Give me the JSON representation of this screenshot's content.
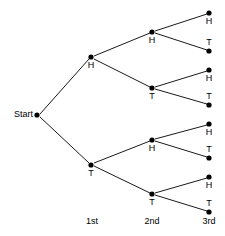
{
  "figure": {
    "type": "tree-diagram",
    "background_color": "#ffffff",
    "line_color": "#1a1a1a",
    "node_color": "#000000",
    "text_color": "#000000"
  },
  "start": {
    "label": "Start",
    "label_x": 33,
    "label_y": 115,
    "node_x": 37,
    "node_y": 115,
    "radius": 2.6
  },
  "stage_labels": [
    {
      "text": "1st",
      "x": 92,
      "y": 224
    },
    {
      "text": "2nd",
      "x": 152,
      "y": 224
    },
    {
      "text": "3rd",
      "x": 209,
      "y": 224
    }
  ],
  "level1": [
    {
      "id": "l1-h",
      "label": "H",
      "node_x": 91,
      "node_y": 57,
      "label_x": 91,
      "label_y": 68,
      "label_position": "below",
      "radius": 2.6
    },
    {
      "id": "l1-t",
      "label": "T",
      "node_x": 91,
      "node_y": 165,
      "label_x": 91,
      "label_y": 176,
      "label_position": "below",
      "radius": 2.6
    }
  ],
  "level2": [
    {
      "id": "l2-hh",
      "label": "H",
      "parent": "l1-h",
      "node_x": 152,
      "node_y": 32,
      "label_x": 152,
      "label_y": 43,
      "label_position": "below",
      "radius": 2.6
    },
    {
      "id": "l2-ht",
      "label": "T",
      "parent": "l1-h",
      "node_x": 152,
      "node_y": 88,
      "label_x": 152,
      "label_y": 99,
      "label_position": "below",
      "radius": 2.6
    },
    {
      "id": "l2-th",
      "label": "H",
      "parent": "l1-t",
      "node_x": 152,
      "node_y": 140,
      "label_x": 152,
      "label_y": 151,
      "label_position": "below",
      "radius": 2.6
    },
    {
      "id": "l2-tt",
      "label": "T",
      "parent": "l1-t",
      "node_x": 152,
      "node_y": 194,
      "label_x": 152,
      "label_y": 205,
      "label_position": "below",
      "radius": 2.6
    }
  ],
  "level3": [
    {
      "id": "l3-hhh",
      "label": "H",
      "parent": "l2-hh",
      "node_x": 209,
      "node_y": 13,
      "label_x": 209,
      "label_y": 24,
      "label_position": "below",
      "radius": 2.6
    },
    {
      "id": "l3-hht",
      "label": "T",
      "parent": "l2-hh",
      "node_x": 209,
      "node_y": 51,
      "label_x": 209,
      "label_y": 45,
      "label_position": "above",
      "radius": 2.6
    },
    {
      "id": "l3-hth",
      "label": "H",
      "parent": "l2-ht",
      "node_x": 209,
      "node_y": 70,
      "label_x": 209,
      "label_y": 81,
      "label_position": "below",
      "radius": 2.6
    },
    {
      "id": "l3-htt",
      "label": "T",
      "parent": "l2-ht",
      "node_x": 209,
      "node_y": 105,
      "label_x": 209,
      "label_y": 99,
      "label_position": "above",
      "radius": 2.6
    },
    {
      "id": "l3-thh",
      "label": "H",
      "parent": "l2-th",
      "node_x": 209,
      "node_y": 124,
      "label_x": 209,
      "label_y": 135,
      "label_position": "below",
      "radius": 2.6
    },
    {
      "id": "l3-tht",
      "label": "T",
      "parent": "l2-th",
      "node_x": 209,
      "node_y": 158,
      "label_x": 209,
      "label_y": 152,
      "label_position": "above",
      "radius": 2.6
    },
    {
      "id": "l3-tth",
      "label": "H",
      "parent": "l2-tt",
      "node_x": 209,
      "node_y": 177,
      "label_x": 209,
      "label_y": 188,
      "label_position": "below",
      "radius": 2.6
    },
    {
      "id": "l3-ttt",
      "label": "T",
      "parent": "l2-tt",
      "node_x": 209,
      "node_y": 212,
      "label_x": 209,
      "label_y": 206,
      "label_position": "above",
      "radius": 2.6
    }
  ],
  "edges": [
    {
      "id": "e-start-h",
      "from": "start",
      "to": "l1-h",
      "x1": 40,
      "y1": 114,
      "x2": 89,
      "y2": 59
    },
    {
      "id": "e-start-t",
      "from": "start",
      "to": "l1-t",
      "x1": 40,
      "y1": 117,
      "x2": 89,
      "y2": 163
    },
    {
      "id": "e-h-hh",
      "from": "l1-h",
      "to": "l2-hh",
      "x1": 94,
      "y1": 56,
      "x2": 150,
      "y2": 33
    },
    {
      "id": "e-h-ht",
      "from": "l1-h",
      "to": "l2-ht",
      "x1": 94,
      "y1": 59,
      "x2": 150,
      "y2": 87
    },
    {
      "id": "e-t-th",
      "from": "l1-t",
      "to": "l2-th",
      "x1": 94,
      "y1": 163,
      "x2": 150,
      "y2": 141
    },
    {
      "id": "e-t-tt",
      "from": "l1-t",
      "to": "l2-tt",
      "x1": 94,
      "y1": 166,
      "x2": 150,
      "y2": 193
    },
    {
      "id": "e-hh-hhh",
      "from": "l2-hh",
      "to": "l3-hhh",
      "x1": 155,
      "y1": 31,
      "x2": 207,
      "y2": 14
    },
    {
      "id": "e-hh-hht",
      "from": "l2-hh",
      "to": "l3-hht",
      "x1": 155,
      "y1": 33,
      "x2": 207,
      "y2": 50
    },
    {
      "id": "e-ht-hth",
      "from": "l2-ht",
      "to": "l3-hth",
      "x1": 155,
      "y1": 87,
      "x2": 207,
      "y2": 71
    },
    {
      "id": "e-ht-htt",
      "from": "l2-ht",
      "to": "l3-htt",
      "x1": 155,
      "y1": 89,
      "x2": 207,
      "y2": 104
    },
    {
      "id": "e-th-thh",
      "from": "l2-th",
      "to": "l3-thh",
      "x1": 155,
      "y1": 139,
      "x2": 207,
      "y2": 125
    },
    {
      "id": "e-th-tht",
      "from": "l2-th",
      "to": "l3-tht",
      "x1": 155,
      "y1": 141,
      "x2": 207,
      "y2": 157
    },
    {
      "id": "e-tt-tth",
      "from": "l2-tt",
      "to": "l3-tth",
      "x1": 155,
      "y1": 193,
      "x2": 207,
      "y2": 178
    },
    {
      "id": "e-tt-ttt",
      "from": "l2-tt",
      "to": "l3-ttt",
      "x1": 155,
      "y1": 195,
      "x2": 207,
      "y2": 211
    }
  ],
  "outcomes": [
    "HHH",
    "HHT",
    "HTH",
    "HTT",
    "THH",
    "THT",
    "TTH",
    "TTT"
  ]
}
